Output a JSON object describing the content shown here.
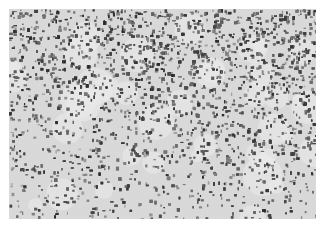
{
  "image": {
    "description": "Grayscale micrograph of densely stained cells, denser toward the top edge",
    "palette": {
      "background": "#d8d8d8",
      "light": "#e4e4e4",
      "cell": "#3a3a3a",
      "cell_mid": "#6a6a6a"
    },
    "density_top": 0.9,
    "density_bottom": 0.3
  }
}
